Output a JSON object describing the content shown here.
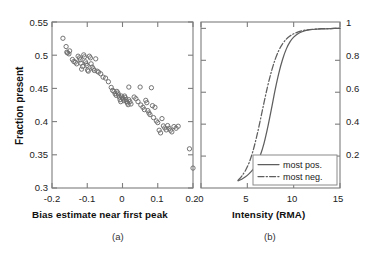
{
  "figure": {
    "background": "#ffffff",
    "marker_color": "#6d6d6d",
    "curve_color": "#5e5e5e",
    "axis_color": "#7d7d7d"
  },
  "panel_a": {
    "caption": "(a)",
    "xlabel": "Bias estimate near first peak",
    "ylabel": "Fraction present",
    "xticks": [
      "-0.2",
      "-0.1",
      "0",
      "0.1",
      "0.2"
    ],
    "yticks": [
      "0.55",
      "0.5",
      "0.45",
      "0.4",
      "0.35",
      "0.3"
    ]
  },
  "panel_b": {
    "caption": "(b)",
    "xlabel": "Intensity (RMA)",
    "xticks": [
      "0",
      "5",
      "10",
      "15"
    ],
    "yticks": [
      "1",
      "0.8",
      "0.6",
      "0.4",
      "0.2"
    ],
    "legend": {
      "items": [
        {
          "label": "most pos.",
          "style": "solid"
        },
        {
          "label": "most neg.",
          "style": "dash-dot"
        }
      ]
    }
  },
  "chart_data": [
    {
      "type": "scatter",
      "panel": "a",
      "title": "",
      "xlabel": "Bias estimate near first peak",
      "ylabel": "Fraction present",
      "xlim": [
        -0.2,
        0.2
      ],
      "ylim": [
        0.3,
        0.55
      ],
      "xticks": [
        -0.2,
        -0.1,
        0,
        0.1,
        0.2
      ],
      "yticks": [
        0.3,
        0.35,
        0.4,
        0.45,
        0.5,
        0.55
      ],
      "grid": false,
      "marker": "open-circle",
      "points": [
        [
          -0.169,
          0.5255
        ],
        [
          -0.16,
          0.513
        ],
        [
          -0.158,
          0.5045
        ],
        [
          -0.156,
          0.5035
        ],
        [
          -0.152,
          0.502
        ],
        [
          -0.15,
          0.5065
        ],
        [
          -0.142,
          0.4935
        ],
        [
          -0.138,
          0.4905
        ],
        [
          -0.134,
          0.4895
        ],
        [
          -0.13,
          0.487
        ],
        [
          -0.126,
          0.4985
        ],
        [
          -0.122,
          0.496
        ],
        [
          -0.12,
          0.493
        ],
        [
          -0.118,
          0.488
        ],
        [
          -0.116,
          0.479
        ],
        [
          -0.113,
          0.483
        ],
        [
          -0.11,
          0.5005
        ],
        [
          -0.108,
          0.4975
        ],
        [
          -0.105,
          0.49
        ],
        [
          -0.103,
          0.487
        ],
        [
          -0.101,
          0.4845
        ],
        [
          -0.099,
          0.4775
        ],
        [
          -0.097,
          0.476
        ],
        [
          -0.094,
          0.4985
        ],
        [
          -0.091,
          0.496
        ],
        [
          -0.089,
          0.487
        ],
        [
          -0.086,
          0.482
        ],
        [
          -0.083,
          0.4795
        ],
        [
          -0.08,
          0.477
        ],
        [
          -0.076,
          0.4945
        ],
        [
          -0.072,
          0.476
        ],
        [
          -0.068,
          0.4745
        ],
        [
          -0.062,
          0.472
        ],
        [
          -0.055,
          0.467
        ],
        [
          -0.048,
          0.4655
        ],
        [
          -0.04,
          0.46
        ],
        [
          -0.032,
          0.4515
        ],
        [
          -0.028,
          0.447
        ],
        [
          -0.024,
          0.4455
        ],
        [
          -0.021,
          0.442
        ],
        [
          -0.018,
          0.4395
        ],
        [
          -0.016,
          0.4455
        ],
        [
          -0.013,
          0.443
        ],
        [
          -0.011,
          0.44
        ],
        [
          -0.009,
          0.437
        ],
        [
          -0.007,
          0.433
        ],
        [
          -0.005,
          0.43
        ],
        [
          -0.003,
          0.4385
        ],
        [
          0.0,
          0.4355
        ],
        [
          0.002,
          0.434
        ],
        [
          0.004,
          0.4315
        ],
        [
          0.006,
          0.4385
        ],
        [
          0.008,
          0.436
        ],
        [
          0.01,
          0.433
        ],
        [
          0.012,
          0.43
        ],
        [
          0.014,
          0.428
        ],
        [
          0.016,
          0.4255
        ],
        [
          0.018,
          0.433
        ],
        [
          0.021,
          0.43
        ],
        [
          0.024,
          0.4265
        ],
        [
          0.018,
          0.452
        ],
        [
          0.033,
          0.437
        ],
        [
          0.038,
          0.4345
        ],
        [
          0.044,
          0.43
        ],
        [
          0.05,
          0.452
        ],
        [
          0.052,
          0.425
        ],
        [
          0.058,
          0.4215
        ],
        [
          0.062,
          0.418
        ],
        [
          0.066,
          0.432
        ],
        [
          0.069,
          0.4285
        ],
        [
          0.072,
          0.4165
        ],
        [
          0.075,
          0.413
        ],
        [
          0.078,
          0.4105
        ],
        [
          0.082,
          0.451
        ],
        [
          0.085,
          0.424
        ],
        [
          0.088,
          0.406
        ],
        [
          0.092,
          0.4215
        ],
        [
          0.096,
          0.401
        ],
        [
          0.1,
          0.3985
        ],
        [
          0.104,
          0.387
        ],
        [
          0.108,
          0.383
        ],
        [
          0.112,
          0.4045
        ],
        [
          0.116,
          0.3935
        ],
        [
          0.12,
          0.3905
        ],
        [
          0.124,
          0.3875
        ],
        [
          0.128,
          0.394
        ],
        [
          0.132,
          0.39
        ],
        [
          0.136,
          0.387
        ],
        [
          0.14,
          0.3845
        ],
        [
          0.146,
          0.3925
        ],
        [
          0.152,
          0.39
        ],
        [
          0.158,
          0.393
        ],
        [
          0.19,
          0.359
        ],
        [
          0.2,
          0.33
        ]
      ]
    },
    {
      "type": "line",
      "panel": "b",
      "title": "",
      "xlabel": "Intensity (RMA)",
      "ylabel": "",
      "xlim": [
        0,
        15
      ],
      "ylim": [
        0,
        1.04
      ],
      "xticks": [
        0,
        5,
        10,
        15
      ],
      "yticks": [
        0.2,
        0.4,
        0.6,
        0.8,
        1
      ],
      "grid": false,
      "legend_position": "lower-right",
      "series": [
        {
          "name": "most pos.",
          "style": "solid",
          "x": [
            4.0,
            4.4,
            4.8,
            5.2,
            5.6,
            6.0,
            6.4,
            6.8,
            7.2,
            7.6,
            8.0,
            8.4,
            8.8,
            9.2,
            9.6,
            10.0,
            10.5,
            11.0,
            11.5,
            12.0,
            13.0,
            14.0,
            15.0
          ],
          "y": [
            0.045,
            0.055,
            0.07,
            0.09,
            0.115,
            0.15,
            0.205,
            0.28,
            0.38,
            0.495,
            0.615,
            0.72,
            0.805,
            0.87,
            0.915,
            0.945,
            0.968,
            0.981,
            0.989,
            0.993,
            0.997,
            0.999,
            1.0
          ]
        },
        {
          "name": "most neg.",
          "style": "dash-dot",
          "x": [
            4.0,
            4.4,
            4.8,
            5.2,
            5.6,
            6.0,
            6.4,
            6.8,
            7.2,
            7.6,
            8.0,
            8.4,
            8.8,
            9.2,
            9.6,
            10.0,
            10.5,
            11.0,
            11.5,
            12.0,
            13.0,
            14.0,
            15.0
          ],
          "y": [
            0.048,
            0.075,
            0.11,
            0.16,
            0.23,
            0.32,
            0.425,
            0.535,
            0.64,
            0.73,
            0.805,
            0.862,
            0.903,
            0.932,
            0.952,
            0.966,
            0.978,
            0.986,
            0.991,
            0.994,
            0.998,
            0.999,
            1.0
          ]
        }
      ]
    }
  ]
}
